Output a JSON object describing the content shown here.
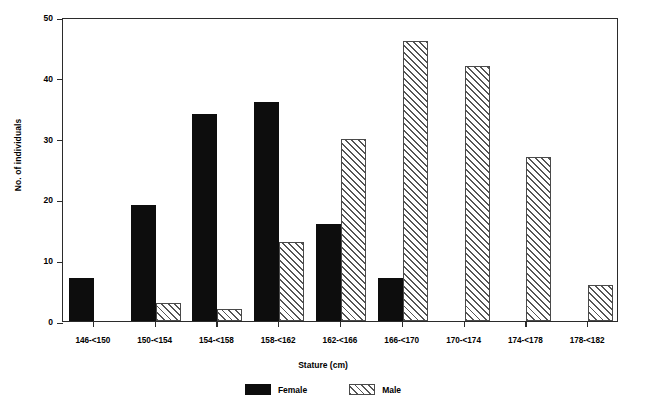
{
  "chart_data": {
    "type": "bar",
    "title": "",
    "xlabel": "Stature (cm)",
    "ylabel": "No. of individuals",
    "categories": [
      "146-<150",
      "150-<154",
      "154-<158",
      "158-<162",
      "162-<166",
      "166-<170",
      "170-<174",
      "174-<178",
      "178-<182"
    ],
    "series": [
      {
        "name": "Female",
        "color": "#0d0d0d",
        "pattern": "solid",
        "values": [
          7,
          19,
          34,
          36,
          16,
          7,
          0,
          0,
          0
        ]
      },
      {
        "name": "Male",
        "color": "#555555",
        "pattern": "diagonal-hatch",
        "values": [
          0,
          3,
          2,
          13,
          30,
          46,
          42,
          27,
          6
        ]
      }
    ],
    "ylim": [
      0,
      50
    ],
    "yticks": [
      0,
      10,
      20,
      30,
      40,
      50
    ],
    "ytick_labels": [
      "0",
      "10",
      "20",
      "30",
      "40",
      "50"
    ],
    "grid": false,
    "legend_position": "bottom",
    "frame": "full-box"
  },
  "axes": {
    "y_title": "No. of individuals",
    "x_title": "Stature (cm)"
  },
  "legend": {
    "items": [
      {
        "label": "Female"
      },
      {
        "label": "Male"
      }
    ]
  }
}
